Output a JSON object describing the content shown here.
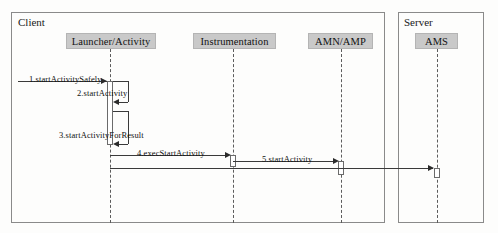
{
  "diagram": {
    "type": "uml-sequence-diagram",
    "frames": [
      {
        "id": "client",
        "label": "Client"
      },
      {
        "id": "server",
        "label": "Server"
      }
    ],
    "participants": [
      {
        "id": "launcher",
        "label": "Launcher/Activity",
        "frame": "client"
      },
      {
        "id": "instrumentation",
        "label": "Instrumentation",
        "frame": "client"
      },
      {
        "id": "amn_amp",
        "label": "AMN/AMP",
        "frame": "client"
      },
      {
        "id": "ams",
        "label": "AMS",
        "frame": "server"
      }
    ],
    "messages": [
      {
        "seq": "1",
        "label": "1.startActivitySafely",
        "from": "actor",
        "to": "launcher",
        "kind": "call"
      },
      {
        "seq": "2",
        "label": "2.startActivity",
        "from": "launcher",
        "to": "launcher",
        "kind": "self"
      },
      {
        "seq": "3",
        "label": "3.startActivityForResult",
        "from": "launcher",
        "to": "launcher",
        "kind": "self"
      },
      {
        "seq": "4",
        "label": "4.execStartActivity",
        "from": "launcher",
        "to": "instrumentation",
        "kind": "call"
      },
      {
        "seq": "5",
        "label": "5.startActivity",
        "from": "instrumentation",
        "to": "amn_amp",
        "kind": "call"
      },
      {
        "seq": "6",
        "label": "",
        "from": "amn_amp",
        "to": "ams",
        "kind": "call"
      }
    ],
    "colors": {
      "participant_fill": "#c9c9c9",
      "frame_border": "#8a8a8a",
      "line": "#3a3a3a",
      "background": "#fdfdfc"
    }
  }
}
